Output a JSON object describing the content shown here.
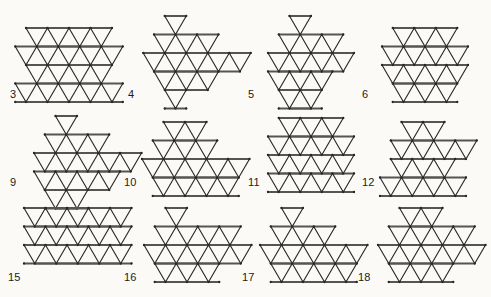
{
  "page": {
    "background_color": "#fbfaf6",
    "line_color": "#2a2a2a",
    "label_color": "#1b1b1b",
    "figure_count": 12
  },
  "geometry": {
    "unit_width": 21.5,
    "unit_height": 18.5,
    "note": "equilateral triangular lattice, horizontal rows"
  },
  "figures": [
    {
      "label": "3",
      "name": "figure-3",
      "shape": "zigzag-parallelogram",
      "x": 18,
      "y": 22,
      "label_x": 10,
      "label_y": 89,
      "origin_x": 8,
      "origin_y": 6,
      "rows": [
        {
          "offset": 0,
          "count": 4,
          "parity": "up"
        },
        {
          "offset": -1,
          "count": 5,
          "parity": "up"
        },
        {
          "offset": 0,
          "count": 4,
          "parity": "up"
        },
        {
          "offset": -1,
          "count": 5,
          "parity": "up"
        }
      ]
    },
    {
      "label": "4",
      "name": "figure-4",
      "shape": "rhombus",
      "x": 140,
      "y": 12,
      "label_x": 128,
      "label_y": 89,
      "origin_x": 14,
      "origin_y": 4,
      "rows": [
        {
          "offset": 1,
          "count": 1,
          "parity": "up"
        },
        {
          "offset": 0,
          "count": 3,
          "parity": "up"
        },
        {
          "offset": -1,
          "count": 5,
          "parity": "up"
        },
        {
          "offset": 0,
          "count": 3,
          "parity": "up"
        },
        {
          "offset": 1,
          "count": 1,
          "parity": "up"
        }
      ]
    },
    {
      "label": "5",
      "name": "figure-5",
      "shape": "slanted-rhombus",
      "x": 258,
      "y": 12,
      "label_x": 248,
      "label_y": 89,
      "origin_x": 10,
      "origin_y": 4,
      "rows": [
        {
          "offset": 2,
          "count": 1,
          "parity": "up"
        },
        {
          "offset": 1,
          "count": 3,
          "parity": "up"
        },
        {
          "offset": 0,
          "count": 4,
          "parity": "up"
        },
        {
          "offset": 0,
          "count": 3,
          "parity": "up"
        },
        {
          "offset": 1,
          "count": 2,
          "parity": "up"
        }
      ]
    },
    {
      "label": "6",
      "name": "figure-6",
      "shape": "hexagon-block",
      "x": 378,
      "y": 24,
      "label_x": 362,
      "label_y": 89,
      "origin_x": 4,
      "origin_y": 4,
      "rows": [
        {
          "offset": 1,
          "count": 3,
          "parity": "up"
        },
        {
          "offset": 0,
          "count": 4,
          "parity": "up"
        },
        {
          "offset": 0,
          "count": 4,
          "parity": "up"
        },
        {
          "offset": 1,
          "count": 3,
          "parity": "up"
        }
      ]
    },
    {
      "label": "9",
      "name": "figure-9",
      "shape": "pointed-triangle",
      "x": 24,
      "y": 112,
      "label_x": 10,
      "label_y": 177,
      "origin_x": 10,
      "origin_y": 4,
      "rows": [
        {
          "offset": 2,
          "count": 1,
          "parity": "up"
        },
        {
          "offset": 1,
          "count": 3,
          "parity": "up"
        },
        {
          "offset": 0,
          "count": 5,
          "parity": "up"
        },
        {
          "offset": 0,
          "count": 4,
          "parity": "up"
        },
        {
          "offset": 1,
          "count": 2,
          "parity": "up"
        }
      ]
    },
    {
      "label": "10",
      "name": "figure-10",
      "shape": "boat-trapezoid",
      "x": 140,
      "y": 118,
      "label_x": 124,
      "label_y": 177,
      "origin_x": 2,
      "origin_y": 4,
      "rows": [
        {
          "offset": 2,
          "count": 2,
          "parity": "up"
        },
        {
          "offset": 1,
          "count": 3,
          "parity": "up"
        },
        {
          "offset": 0,
          "count": 5,
          "parity": "up"
        },
        {
          "offset": 1,
          "count": 4,
          "parity": "up"
        }
      ]
    },
    {
      "label": "11",
      "name": "figure-11",
      "shape": "vase",
      "x": 262,
      "y": 114,
      "label_x": 248,
      "label_y": 177,
      "origin_x": 6,
      "origin_y": 4,
      "rows": [
        {
          "offset": 1,
          "count": 3,
          "parity": "up"
        },
        {
          "offset": 0,
          "count": 4,
          "parity": "up"
        },
        {
          "offset": 0,
          "count": 4,
          "parity": "up"
        },
        {
          "offset": 0,
          "count": 4,
          "parity": "up"
        }
      ]
    },
    {
      "label": "12",
      "name": "figure-12",
      "shape": "stepped-hexagon",
      "x": 378,
      "y": 118,
      "label_x": 362,
      "label_y": 177,
      "origin_x": 2,
      "origin_y": 4,
      "rows": [
        {
          "offset": 2,
          "count": 2,
          "parity": "up"
        },
        {
          "offset": 1,
          "count": 4,
          "parity": "up"
        },
        {
          "offset": 1,
          "count": 3,
          "parity": "up"
        },
        {
          "offset": 0,
          "count": 4,
          "parity": "up"
        }
      ]
    },
    {
      "label": "15",
      "name": "figure-15",
      "shape": "wide-parallelogram",
      "x": 20,
      "y": 204,
      "label_x": 8,
      "label_y": 272,
      "origin_x": 4,
      "origin_y": 4,
      "rows": [
        {
          "offset": 0,
          "count": 5,
          "parity": "up"
        },
        {
          "offset": 0,
          "count": 5,
          "parity": "up"
        },
        {
          "offset": 0,
          "count": 5,
          "parity": "up"
        }
      ]
    },
    {
      "label": "16",
      "name": "figure-16",
      "shape": "skew-hexagon",
      "x": 140,
      "y": 204,
      "label_x": 124,
      "label_y": 272,
      "origin_x": 4,
      "origin_y": 4,
      "rows": [
        {
          "offset": 2,
          "count": 1,
          "parity": "up"
        },
        {
          "offset": 1,
          "count": 4,
          "parity": "up"
        },
        {
          "offset": 0,
          "count": 5,
          "parity": "up"
        },
        {
          "offset": 1,
          "count": 3,
          "parity": "up"
        }
      ]
    },
    {
      "label": "17",
      "name": "figure-17",
      "shape": "diagonal-hexagon",
      "x": 256,
      "y": 204,
      "label_x": 242,
      "label_y": 272,
      "origin_x": 4,
      "origin_y": 4,
      "rows": [
        {
          "offset": 2,
          "count": 1,
          "parity": "up"
        },
        {
          "offset": 1,
          "count": 3,
          "parity": "up"
        },
        {
          "offset": 0,
          "count": 5,
          "parity": "up"
        },
        {
          "offset": 1,
          "count": 4,
          "parity": "up"
        }
      ]
    },
    {
      "label": "18",
      "name": "figure-18",
      "shape": "wide-hexagon",
      "x": 374,
      "y": 204,
      "label_x": 358,
      "label_y": 272,
      "origin_x": 4,
      "origin_y": 4,
      "rows": [
        {
          "offset": 2,
          "count": 2,
          "parity": "up"
        },
        {
          "offset": 1,
          "count": 4,
          "parity": "up"
        },
        {
          "offset": 0,
          "count": 5,
          "parity": "up"
        },
        {
          "offset": 1,
          "count": 3,
          "parity": "up"
        }
      ]
    }
  ]
}
